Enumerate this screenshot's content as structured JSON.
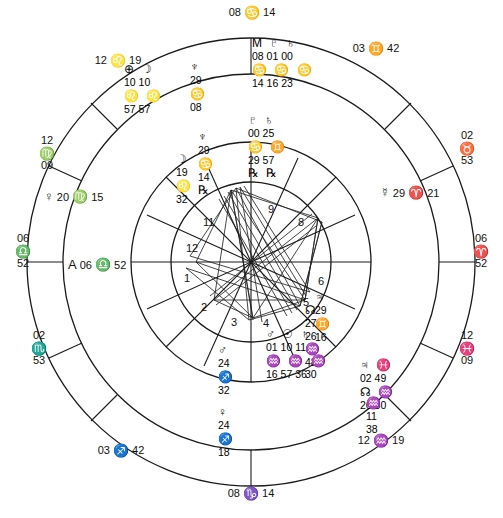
{
  "chart_data": {
    "type": "other",
    "angles": {
      "asc_label": "06 ♈ 52",
      "dsc_label": "06 ♈ 52",
      "mc_label": "08 ♋ 14",
      "ic_label": "08 ♑ 14"
    }
  },
  "wheel": {
    "cusps": [
      {
        "name": "mc",
        "deg": "08",
        "sign": "♋",
        "min": "14",
        "x": 251,
        "y": 12,
        "layout": "inline"
      },
      {
        "name": "c11",
        "deg": "03",
        "sign": "♊",
        "min": "42",
        "x": 376,
        "y": 48,
        "layout": "inline"
      },
      {
        "name": "c12",
        "deg": "02",
        "sign": "♉",
        "min": "53",
        "x": 467,
        "y": 140,
        "layout": "stacked"
      },
      {
        "name": "dsc",
        "deg": "06",
        "sign": "♈",
        "min": "52",
        "x": 481,
        "y": 243,
        "layout": "stacked"
      },
      {
        "name": "c2",
        "deg": "12",
        "sign": "♓",
        "min": "09",
        "x": 466,
        "y": 340,
        "layout": "stacked"
      },
      {
        "name": "c3",
        "deg": "12",
        "sign": "♒",
        "min": "19",
        "x": 381,
        "y": 440,
        "layout": "inline"
      },
      {
        "name": "ic",
        "deg": "08",
        "sign": "♑",
        "min": "14",
        "x": 251,
        "y": 493,
        "layout": "inline"
      },
      {
        "name": "c5",
        "deg": "03",
        "sign": "♐",
        "min": "42",
        "x": 121,
        "y": 450,
        "layout": "inline"
      },
      {
        "name": "c6",
        "deg": "02",
        "sign": "♏",
        "min": "53",
        "x": 38,
        "y": 340,
        "layout": "stacked"
      },
      {
        "name": "asc",
        "deg": "06",
        "sign": "♎",
        "min": "52",
        "x": 21,
        "y": 243,
        "layout": "stacked"
      },
      {
        "name": "c8",
        "deg": "12",
        "sign": "♍",
        "min": "09",
        "x": 45,
        "y": 145,
        "layout": "stacked"
      },
      {
        "name": "c9",
        "deg": "12",
        "sign": "♌",
        "min": "19",
        "x": 118,
        "y": 60,
        "layout": "inline"
      }
    ],
    "house_numbers": [
      {
        "n": "11",
        "x": 203,
        "y": 216
      },
      {
        "n": "12",
        "x": 186,
        "y": 242
      },
      {
        "n": "1",
        "x": 184,
        "y": 272
      },
      {
        "n": "2",
        "x": 201,
        "y": 301
      },
      {
        "n": "3",
        "x": 231,
        "y": 316
      },
      {
        "n": "4",
        "x": 263,
        "y": 317
      },
      {
        "n": "5",
        "x": 303,
        "y": 296
      },
      {
        "n": "6",
        "x": 318,
        "y": 275
      },
      {
        "n": "8",
        "x": 298,
        "y": 216
      },
      {
        "n": "9",
        "x": 268,
        "y": 203
      }
    ],
    "planets": [
      {
        "name": "ascendant-point",
        "sym": "A",
        "deg": "06",
        "sign": "♎",
        "min": "52",
        "x": 70,
        "y": 258,
        "style": "inline"
      },
      {
        "name": "venus",
        "sym": "♀",
        "deg": "20",
        "sign": "♍",
        "min": "15",
        "x": 46,
        "y": 190,
        "style": "inline"
      },
      {
        "name": "mercury",
        "sym": "☿",
        "deg": "29",
        "sign": "♈",
        "min": "21",
        "x": 382,
        "y": 186,
        "style": "inline"
      }
    ],
    "clusters": [
      {
        "name": "upper-left-cluster",
        "x": 124,
        "y": 62,
        "rows": [
          {
            "type": "sym",
            "text": "⊕ ☽"
          },
          {
            "type": "num",
            "text": "10 10"
          },
          {
            "type": "sym",
            "text": "♌ ♌"
          },
          {
            "type": "num",
            "text": "57 57"
          }
        ]
      },
      {
        "name": "neptune-cluster",
        "x": 190,
        "y": 60,
        "rows": [
          {
            "type": "sym",
            "text": "♆"
          },
          {
            "type": "num",
            "text": "29"
          },
          {
            "type": "sym",
            "text": "♋"
          },
          {
            "type": "num",
            "text": "08"
          }
        ]
      },
      {
        "name": "mc-cluster",
        "x": 252,
        "y": 36,
        "rows": [
          {
            "type": "sym",
            "text": "M ♇ ♄"
          },
          {
            "type": "num",
            "text": "08 01 00"
          },
          {
            "type": "sym",
            "text": "♋ ♋ ♋"
          },
          {
            "type": "num",
            "text": "14 16 23"
          }
        ]
      },
      {
        "name": "pluto-saturn-cluster",
        "x": 248,
        "y": 113,
        "rows": [
          {
            "type": "sym",
            "text": "♇ ♄"
          },
          {
            "type": "num",
            "text": "00 25"
          },
          {
            "type": "sym",
            "text": "♋ ♊"
          },
          {
            "type": "num",
            "text": "29 57"
          },
          {
            "type": "sym",
            "text": "℞ ℞"
          }
        ]
      },
      {
        "name": "uranus-cluster",
        "x": 198,
        "y": 130,
        "rows": [
          {
            "type": "sym",
            "text": "♆"
          },
          {
            "type": "num",
            "text": "29"
          },
          {
            "type": "sym",
            "text": "♋"
          },
          {
            "type": "num",
            "text": "14"
          },
          {
            "type": "sym",
            "text": "℞"
          }
        ]
      },
      {
        "name": "moon-cluster",
        "x": 176,
        "y": 152,
        "rows": [
          {
            "type": "sym",
            "text": "☽"
          },
          {
            "type": "num",
            "text": "19"
          },
          {
            "type": "sym",
            "text": "♌"
          },
          {
            "type": "num",
            "text": "32"
          }
        ]
      },
      {
        "name": "node-jupiter-cluster",
        "x": 315,
        "y": 290,
        "rows": [
          {
            "type": "sym",
            "text": "♃"
          },
          {
            "type": "num",
            "text": "29"
          },
          {
            "type": "sym",
            "text": "♊"
          },
          {
            "type": "num",
            "text": "16"
          }
        ]
      },
      {
        "name": "aquarius-stack-right",
        "x": 305,
        "y": 303,
        "rows": [
          {
            "type": "sym",
            "text": "☊"
          },
          {
            "type": "num",
            "text": "27"
          },
          {
            "type": "num",
            "text": "26"
          },
          {
            "type": "sym",
            "text": "♒"
          },
          {
            "type": "num",
            "text": "48"
          },
          {
            "type": "num",
            "text": "30"
          }
        ]
      },
      {
        "name": "sun-mars-cluster",
        "x": 266,
        "y": 327,
        "rows": [
          {
            "type": "sym",
            "text": "♂ ☉ ♄"
          },
          {
            "type": "num",
            "text": "01 10 11"
          },
          {
            "type": "sym",
            "text": "♒ ♒ ♒"
          },
          {
            "type": "num",
            "text": "16 57 36"
          }
        ]
      },
      {
        "name": "jupiter-pisces-cluster",
        "x": 360,
        "y": 358,
        "rows": [
          {
            "type": "sym",
            "text": "♃ ♓"
          },
          {
            "type": "num",
            "text": "02 49"
          },
          {
            "type": "sym",
            "text": "☊ ♒"
          },
          {
            "type": "num",
            "text": "26 30"
          }
        ]
      },
      {
        "name": "aquarius-lower-cluster",
        "x": 366,
        "y": 396,
        "rows": [
          {
            "type": "sym",
            "text": "♒"
          },
          {
            "type": "num",
            "text": "11"
          },
          {
            "type": "num",
            "text": "38"
          }
        ]
      },
      {
        "name": "mars-sagittarius-cluster",
        "x": 218,
        "y": 343,
        "rows": [
          {
            "type": "sym",
            "text": "♂"
          },
          {
            "type": "num",
            "text": "24"
          },
          {
            "type": "sym",
            "text": "♐"
          },
          {
            "type": "num",
            "text": "32"
          }
        ]
      },
      {
        "name": "venus-sagittarius-cluster",
        "x": 218,
        "y": 405,
        "rows": [
          {
            "type": "sym",
            "text": "♀"
          },
          {
            "type": "num",
            "text": "24"
          },
          {
            "type": "sym",
            "text": "♐"
          },
          {
            "type": "num",
            "text": "18"
          }
        ]
      }
    ]
  },
  "colors": {
    "ink": "#111111",
    "background": "#ffffff",
    "line": "#1a1a1a"
  }
}
